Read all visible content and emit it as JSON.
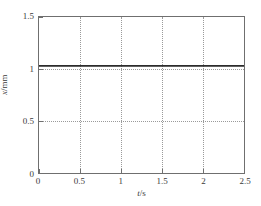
{
  "chart_data": {
    "type": "line",
    "title": "",
    "subtitle": "",
    "xlabel": "t/s",
    "xlabel_var": "t",
    "xlabel_rest": "/s",
    "ylabel": "x/mm",
    "ylabel_var": "x",
    "ylabel_rest": "/mm",
    "xlim": [
      0,
      2.5
    ],
    "ylim": [
      0,
      1.5
    ],
    "xticks": [
      0,
      0.5,
      1,
      1.5,
      2,
      2.5
    ],
    "xticklabels": [
      "0",
      "0.5",
      "1",
      "1.5",
      "2",
      "2.5"
    ],
    "yticks": [
      0,
      0.5,
      1,
      1.5
    ],
    "yticklabels": [
      "0",
      "0.5",
      "1",
      "1.5"
    ],
    "grid": true,
    "grid_style": "dotted",
    "grid_color": "#9a9a9a",
    "legend": false,
    "legend_position": "none",
    "axis_color": "#6f6f6f",
    "line_color": "#2b2b2b",
    "background": "#ffffff",
    "series": [
      {
        "name": "x",
        "color": "#2b2b2b",
        "x": [
          0,
          0.1,
          0.2,
          0.3,
          0.4,
          0.5,
          0.6,
          0.7,
          0.8,
          0.9,
          1.0,
          1.1,
          1.2,
          1.3,
          1.4,
          1.5,
          1.6,
          1.7,
          1.8,
          1.9,
          2.0,
          2.1,
          2.2,
          2.3,
          2.4,
          2.5
        ],
        "values": [
          1.03,
          1.03,
          1.03,
          1.03,
          1.03,
          1.03,
          1.03,
          1.03,
          1.03,
          1.03,
          1.03,
          1.03,
          1.03,
          1.03,
          1.03,
          1.03,
          1.03,
          1.03,
          1.03,
          1.03,
          1.03,
          1.03,
          1.03,
          1.03,
          1.03,
          1.03
        ]
      }
    ]
  }
}
